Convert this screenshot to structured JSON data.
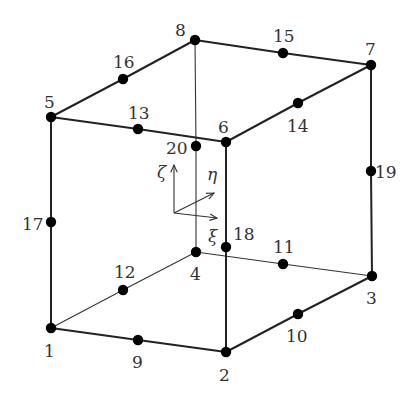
{
  "diagram": {
    "type": "20-node hexahedral (serendipity) finite element",
    "colors": {
      "line": "#222222",
      "node": "#000000",
      "text": "#333333",
      "background": "#ffffff"
    },
    "nodes": [
      {
        "id": "1",
        "x": 51,
        "y": 328,
        "label_x": 44,
        "label_y": 357
      },
      {
        "id": "2",
        "x": 226,
        "y": 352,
        "label_x": 219,
        "label_y": 381
      },
      {
        "id": "3",
        "x": 372,
        "y": 276,
        "label_x": 366,
        "label_y": 304
      },
      {
        "id": "4",
        "x": 196,
        "y": 252,
        "label_x": 190,
        "label_y": 280
      },
      {
        "id": "5",
        "x": 51,
        "y": 117,
        "label_x": 44,
        "label_y": 108
      },
      {
        "id": "6",
        "x": 226,
        "y": 142,
        "label_x": 218,
        "label_y": 133
      },
      {
        "id": "7",
        "x": 371,
        "y": 65,
        "label_x": 365,
        "label_y": 55
      },
      {
        "id": "8",
        "x": 195,
        "y": 40,
        "label_x": 175,
        "label_y": 36
      },
      {
        "id": "9",
        "x": 138,
        "y": 340,
        "label_x": 132,
        "label_y": 368
      },
      {
        "id": "10",
        "x": 298,
        "y": 314,
        "label_x": 286,
        "label_y": 342
      },
      {
        "id": "11",
        "x": 283,
        "y": 264,
        "label_x": 273,
        "label_y": 253
      },
      {
        "id": "12",
        "x": 123,
        "y": 290,
        "label_x": 114,
        "label_y": 278
      },
      {
        "id": "13",
        "x": 138,
        "y": 129,
        "label_x": 128,
        "label_y": 119
      },
      {
        "id": "14",
        "x": 298,
        "y": 103,
        "label_x": 287,
        "label_y": 132
      },
      {
        "id": "15",
        "x": 283,
        "y": 53,
        "label_x": 273,
        "label_y": 42
      },
      {
        "id": "16",
        "x": 123,
        "y": 79,
        "label_x": 113,
        "label_y": 68
      },
      {
        "id": "17",
        "x": 51,
        "y": 222,
        "label_x": 22,
        "label_y": 230
      },
      {
        "id": "18",
        "x": 226,
        "y": 247,
        "label_x": 233,
        "label_y": 240
      },
      {
        "id": "19",
        "x": 371,
        "y": 171,
        "label_x": 375,
        "label_y": 178
      },
      {
        "id": "20",
        "x": 196,
        "y": 146,
        "label_x": 166,
        "label_y": 154
      }
    ],
    "visible_edges": [
      [
        "5",
        "13",
        "6"
      ],
      [
        "8",
        "16",
        "5"
      ],
      [
        "8",
        "15",
        "7"
      ],
      [
        "6",
        "14",
        "7"
      ],
      [
        "5",
        "17",
        "1"
      ],
      [
        "6",
        "18",
        "2"
      ],
      [
        "7",
        "19",
        "3"
      ],
      [
        "1",
        "9",
        "2"
      ],
      [
        "2",
        "10",
        "3"
      ]
    ],
    "hidden_edges": [
      [
        "8",
        "20",
        "4"
      ],
      [
        "1",
        "12",
        "4"
      ],
      [
        "4",
        "11",
        "3"
      ]
    ],
    "local_axes": {
      "origin": {
        "x": 174,
        "y": 213
      },
      "axes": [
        {
          "name": "zeta",
          "symbol": "ζ",
          "tip_x": 174,
          "tip_y": 165,
          "label_x": 157,
          "label_y": 178
        },
        {
          "name": "eta",
          "symbol": "η",
          "tip_x": 214,
          "tip_y": 193,
          "label_x": 207,
          "label_y": 180
        },
        {
          "name": "xi",
          "symbol": "ξ",
          "tip_x": 217,
          "tip_y": 218,
          "label_x": 208,
          "label_y": 242
        }
      ]
    }
  }
}
